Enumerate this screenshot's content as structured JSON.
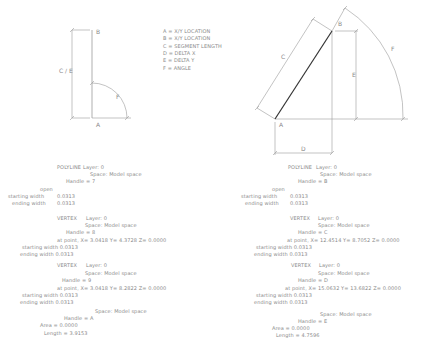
{
  "legend": {
    "items": [
      "A = X/Y LOCATION",
      "B = X/Y LOCATION",
      "C = SEGMENT LENGTH",
      "D = DELTA X",
      "E = DELTA Y",
      "F = ANGLE"
    ]
  },
  "left_diagram": {
    "labels": {
      "a": "A",
      "b": "B",
      "ce": "C / E",
      "f": "F"
    }
  },
  "right_diagram": {
    "labels": {
      "a": "A",
      "b": "B",
      "c": "C",
      "d": "D",
      "e": "E",
      "f": "F"
    },
    "line_color": "#333333"
  },
  "left_listing": {
    "header": {
      "entity": "POLYLINE",
      "layer": "Layer: 0",
      "space": "Space: Model space",
      "handle": "Handle = 7"
    },
    "open": "open",
    "starting_width_label": "starting width",
    "starting_width": "0.0313",
    "ending_width_label": "ending width",
    "ending_width": "0.0313",
    "vertices": [
      {
        "entity": "VERTEX",
        "layer": "Layer: 0",
        "space": "Space: Model space",
        "handle": "Handle = 8",
        "point": "at point,  X=  3.0418   Y=   4.3728   Z=  0.0000",
        "starting_width": "starting width  0.0313",
        "ending_width": "ending width    0.0313"
      },
      {
        "entity": "VERTEX",
        "layer": "Layer: 0",
        "space": "Space: Model space",
        "handle": "Handle = 9",
        "point": "at point,  X=  3.0418   Y=   8.2822   Z=  0.0000",
        "starting_width": "starting width  0.0313",
        "ending_width": "ending width    0.0313"
      }
    ],
    "footer": {
      "space": "Space: Model space",
      "handle": "Handle = A",
      "area": "Area  = 0.0000",
      "length": "Length = 3.9153"
    }
  },
  "right_listing": {
    "header": {
      "entity": "POLYLINE",
      "layer": "Layer: 0",
      "space": "Space: Model space",
      "handle": "Handle = B"
    },
    "open": "open",
    "starting_width_label": "starting width",
    "starting_width": "0.0313",
    "ending_width_label": "ending width",
    "ending_width": "0.0313",
    "vertices": [
      {
        "entity": "VERTEX",
        "layer": "Layer: 0",
        "space": "Space: Model space",
        "handle": "Handle = C",
        "point": "at point,  X=  12.4514   Y=   8.7052   Z=  0.0000",
        "starting_width": "starting width  0.0313",
        "ending_width": "ending width    0.0313"
      },
      {
        "entity": "VERTEX",
        "layer": "Layer: 0",
        "space": "Space: Model space",
        "handle": "Handle = D",
        "point": "at point,  X=  15.0632   Y=   13.6822   Z=  0.0000",
        "starting_width": "starting width  0.0313",
        "ending_width": "ending width    0.0313"
      }
    ],
    "footer": {
      "space": "Space: Model space",
      "handle": "Handle = E",
      "area": "Area  = 0.0000",
      "length": "Length = 4.7596"
    }
  }
}
